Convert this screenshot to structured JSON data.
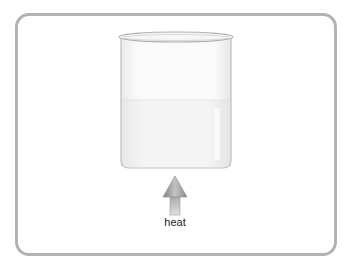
{
  "diagram": {
    "title": "",
    "elements": {
      "container": "beaker with liquid",
      "arrow": {
        "direction": "up",
        "label": "heat"
      }
    },
    "colors": {
      "frame": "#b3b3b3",
      "beaker_outline": "#b8b8b8",
      "liquid": "#f1f1f1",
      "arrow": "#9a9a9a"
    }
  },
  "labels": {
    "heat": "heat"
  }
}
